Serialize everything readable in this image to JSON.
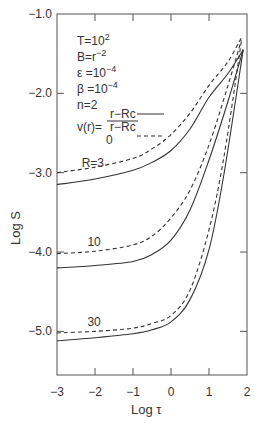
{
  "chart_data": {
    "type": "line",
    "title": "",
    "xlabel": "Log τ",
    "ylabel": "Log S",
    "xlim": [
      -3,
      2
    ],
    "ylim": [
      -5.55,
      -1.0
    ],
    "x_ticks": [
      -3,
      -2,
      -1,
      0,
      1,
      2
    ],
    "x_tick_labels": [
      "−3",
      "−2",
      "−1",
      "0",
      "1",
      "2"
    ],
    "y_ticks": [
      -1.0,
      -2.0,
      -3.0,
      -4.0,
      -5.0
    ],
    "y_tick_labels": [
      "−1.0",
      "−2.0",
      "−3.0",
      "−4.0",
      "−5.0"
    ],
    "grid": false,
    "annotations": {
      "params": [
        {
          "base": "T=10",
          "sup": "2"
        },
        {
          "base": "B=r",
          "sup": "−2"
        },
        {
          "base": "ε =10",
          "sup": "−4"
        },
        {
          "base": "β =10",
          "sup": "−4"
        },
        {
          "base": "n=2",
          "sup": ""
        }
      ],
      "legend_prefix": "v(r)=",
      "legend": [
        {
          "label_num": "r−Rc",
          "label_den": "r−Rc",
          "style": "solid"
        },
        {
          "label": "0",
          "style": "dashed"
        }
      ],
      "curve_labels": [
        {
          "text": "R=3",
          "x": -2.35,
          "y": -2.93
        },
        {
          "text": "10",
          "x": -2.2,
          "y": -3.93
        },
        {
          "text": "30",
          "x": -2.2,
          "y": -4.93
        }
      ]
    },
    "series": [
      {
        "name": "R=3, v(r)=(r−Rc)/(r−Rc)",
        "style": "solid",
        "x": [
          -3,
          -2,
          -1,
          -0.5,
          0,
          0.5,
          1,
          1.5,
          1.9
        ],
        "y": [
          -3.15,
          -3.08,
          -2.97,
          -2.87,
          -2.72,
          -2.45,
          -2.05,
          -1.75,
          -1.45
        ]
      },
      {
        "name": "R=3, v(r)=0",
        "style": "dashed",
        "x": [
          -3,
          -2,
          -1,
          -0.5,
          0,
          0.5,
          1,
          1.5,
          1.85
        ],
        "y": [
          -3.0,
          -2.93,
          -2.82,
          -2.7,
          -2.52,
          -2.25,
          -1.9,
          -1.6,
          -1.3
        ]
      },
      {
        "name": "R=10, v(r)=(r−Rc)/(r−Rc)",
        "style": "solid",
        "x": [
          -3,
          -2,
          -1,
          -0.5,
          0,
          0.5,
          1,
          1.5,
          1.9
        ],
        "y": [
          -4.2,
          -4.17,
          -4.12,
          -4.03,
          -3.85,
          -3.47,
          -2.84,
          -2.1,
          -1.45
        ]
      },
      {
        "name": "R=10, v(r)=0",
        "style": "dashed",
        "x": [
          -3,
          -2,
          -1,
          -0.5,
          0,
          0.5,
          1,
          1.5,
          1.85
        ],
        "y": [
          -4.02,
          -3.99,
          -3.91,
          -3.8,
          -3.57,
          -3.22,
          -2.65,
          -1.9,
          -1.33
        ]
      },
      {
        "name": "R=30, v(r)=(r−Rc)/(r−Rc)",
        "style": "solid",
        "x": [
          -3,
          -2,
          -1,
          -0.5,
          0,
          0.5,
          1,
          1.4,
          1.9
        ],
        "y": [
          -5.12,
          -5.08,
          -5.03,
          -4.98,
          -4.88,
          -4.6,
          -3.97,
          -3.0,
          -1.45
        ]
      },
      {
        "name": "R=30, v(r)=0",
        "style": "dashed",
        "x": [
          -3,
          -2,
          -1,
          -0.5,
          0,
          0.5,
          1,
          1.4,
          1.85
        ],
        "y": [
          -5.02,
          -5.0,
          -4.96,
          -4.9,
          -4.8,
          -4.48,
          -3.72,
          -2.78,
          -1.35
        ]
      }
    ]
  }
}
